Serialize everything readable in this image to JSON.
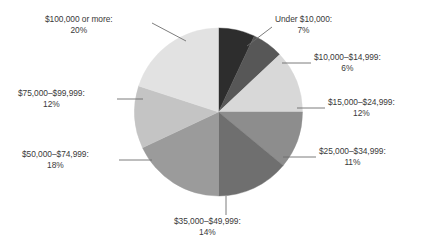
{
  "chart_data": {
    "type": "pie",
    "title": "",
    "subtitle": "",
    "xlabel": "",
    "ylabel": "",
    "legend_position": "none",
    "grid": false,
    "label_format": "{category}:\n{value}%",
    "start_angle_deg": 0,
    "direction": "clockwise",
    "categories": [
      "Under $10,000",
      "$10,000–$14,999",
      "$15,000–$24,999",
      "$25,000–$34,999",
      "$35,000–$49,999",
      "$50,000–$74,999",
      "$75,000–$99,999",
      "$100,000 or more"
    ],
    "values": [
      7,
      6,
      12,
      11,
      14,
      18,
      12,
      20
    ],
    "value_labels": [
      "7%",
      "6%",
      "12%",
      "11%",
      "14%",
      "18%",
      "12%",
      "20%"
    ],
    "colors": [
      "#2d2d2d",
      "#575757",
      "#d8d8d8",
      "#8d8d8d",
      "#6f6f6f",
      "#9b9b9b",
      "#c4c4c4",
      "#e2e2e2"
    ],
    "total": 100,
    "units": "percent"
  },
  "callouts": [
    {
      "id": "under-10000",
      "category": "Under $10,000",
      "percent": "7%"
    },
    {
      "id": "10000-14999",
      "category": "$10,000–$14,999",
      "percent": "6%"
    },
    {
      "id": "15000-24999",
      "category": "$15,000–$24,999",
      "percent": "12%"
    },
    {
      "id": "25000-34999",
      "category": "$25,000–$34,999",
      "percent": "11%"
    },
    {
      "id": "35000-49999",
      "category": "$35,000–$49,999",
      "percent": "14%"
    },
    {
      "id": "50000-74999",
      "category": "$50,000–$74,999",
      "percent": "18%"
    },
    {
      "id": "75000-99999",
      "category": "$75,000–$99,999",
      "percent": "12%"
    },
    {
      "id": "100000-or-more",
      "category": "$100,000 or more",
      "percent": "20%"
    }
  ],
  "style": {
    "background": "#ffffff",
    "text_color": "#3a3a3a",
    "leader_line_color": "#6e6e6e"
  }
}
